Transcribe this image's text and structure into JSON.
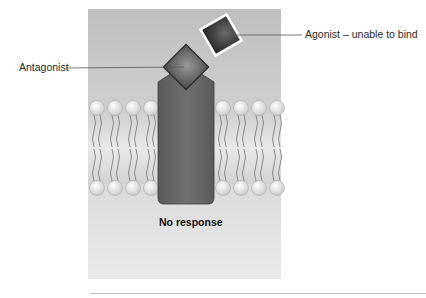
{
  "figure": {
    "labels": {
      "antagonist": "Antagonist",
      "agonist": "Agonist – unable to bind",
      "caption": "No response"
    },
    "colors": {
      "panel_top": "#bfbfbf",
      "panel_bottom": "#eaeaea",
      "receptor": "#616161",
      "antagonist": "#5a5a5a",
      "agonist": "#2f2f2f",
      "lipid_head": "#e4e4e4",
      "lipid_tail": "#8a8a8a",
      "leader_line": "#555555"
    }
  }
}
